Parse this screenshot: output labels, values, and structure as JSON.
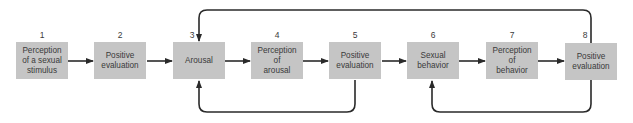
{
  "diagram": {
    "type": "flowchart",
    "steps": [
      {
        "number": "1",
        "label": "Perception\nof a sexual\nstimulus"
      },
      {
        "number": "2",
        "label": "Positive\nevaluation"
      },
      {
        "number": "3",
        "label": "Arousal"
      },
      {
        "number": "4",
        "label": "Perception\nof\narousal"
      },
      {
        "number": "5",
        "label": "Positive\nevaluation"
      },
      {
        "number": "6",
        "label": "Sexual\nbehavior"
      },
      {
        "number": "7",
        "label": "Perception\nof\nbehavior"
      },
      {
        "number": "8",
        "label": "Positive\nevaluation"
      }
    ],
    "connections": [
      {
        "from": "1",
        "to": "2"
      },
      {
        "from": "2",
        "to": "3"
      },
      {
        "from": "3",
        "to": "4"
      },
      {
        "from": "4",
        "to": "5"
      },
      {
        "from": "5",
        "to": "6"
      },
      {
        "from": "6",
        "to": "7"
      },
      {
        "from": "7",
        "to": "8"
      },
      {
        "from": "5",
        "to": "3",
        "type": "feedback-loop-bottom"
      },
      {
        "from": "8",
        "to": "3",
        "type": "feedback-loop-top"
      },
      {
        "from": "8",
        "to": "6",
        "type": "feedback-loop-bottom"
      }
    ],
    "colors": {
      "box_fill": "#c5c5c5",
      "text": "#3a3a3a",
      "line": "#2a2a2a"
    }
  }
}
